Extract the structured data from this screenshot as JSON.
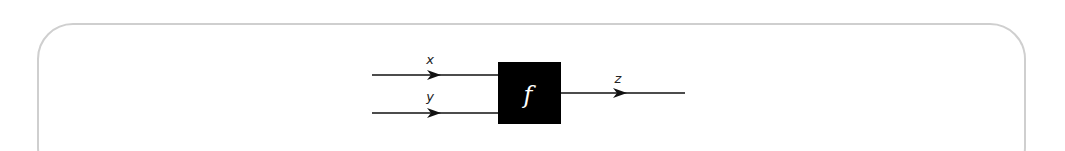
{
  "diagram": {
    "type": "function-block",
    "block": {
      "label": "f",
      "fill": "#000000",
      "text_color": "#ffffff"
    },
    "inputs": [
      {
        "label": "x"
      },
      {
        "label": "y"
      }
    ],
    "output": {
      "label": "z"
    },
    "line_color": "#111111",
    "frame_border_color": "#cfcfcf"
  }
}
